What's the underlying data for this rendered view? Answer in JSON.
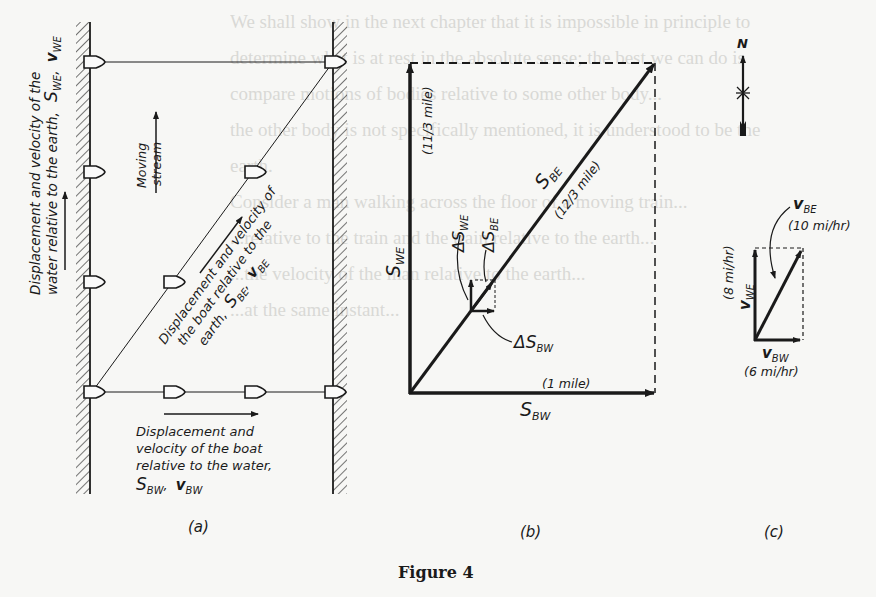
{
  "figure": {
    "caption": "Figure 4",
    "bleed_through_text": [
      "We shall show in the next chapter that it is impossible in principle to",
      "determine what is at rest in the absolute sense; the best we can do is",
      "compare motions of bodies relative to some other body...",
      "the other body is not specifically mentioned, it is understood to be the",
      "earth.",
      "Consider a man walking across the floor of a moving train...",
      "...relative to the train and the train relative to the earth...",
      "...the velocity of the man relative to the earth...",
      "...at the same instant..."
    ]
  },
  "panel_a": {
    "label": "(a)",
    "water_label_line1": "Displacement and velocity of the",
    "water_label_line2": "water relative to the earth,",
    "water_symbols": "S",
    "water_sub_s": "WE",
    "water_sep": ",",
    "water_v": "v",
    "water_sub_v": "WE",
    "stream_line1": "Moving",
    "stream_line2": "stream",
    "boat_earth_line1": "Displacement and velocity of",
    "boat_earth_line2": "the boat relative to the",
    "boat_earth_line3": "earth,",
    "boat_earth_s": "S",
    "boat_earth_sub_s": "BE",
    "boat_earth_v": "v",
    "boat_earth_sub_v": "BE",
    "boat_water_line1": "Displacement and",
    "boat_water_line2": "velocity of the boat",
    "boat_water_line3": "relative to the water,",
    "boat_water_s": "S",
    "boat_water_sub_s": "BW",
    "boat_water_v": "v",
    "boat_water_sub_v": "BW"
  },
  "panel_b": {
    "label": "(b)",
    "s_we": "S",
    "s_we_sub": "WE",
    "s_we_value": "(11/3 mile)",
    "s_be": "S",
    "s_be_sub": "BE",
    "s_be_value": "(12/3 mile)",
    "s_bw": "S",
    "s_bw_sub": "BW",
    "s_bw_value": "(1 mile)",
    "d_swe": "ΔS",
    "d_swe_sub": "WE",
    "d_sbe": "ΔS",
    "d_sbe_sub": "BE",
    "d_sbw": "ΔS",
    "d_sbw_sub": "BW"
  },
  "panel_c": {
    "label": "(c)",
    "compass": "N",
    "v_be": "v",
    "v_be_sub": "BE",
    "v_be_value": "(10 mi/hr)",
    "v_we": "v",
    "v_we_sub": "WE",
    "v_we_value": "(8 mi/hr)",
    "v_bw": "v",
    "v_bw_sub": "BW",
    "v_bw_value": "(6 mi/hr)"
  },
  "colors": {
    "ink": "#1a1a1a",
    "paper": "#f7f7f5",
    "bleed": "#d9d9d6"
  }
}
